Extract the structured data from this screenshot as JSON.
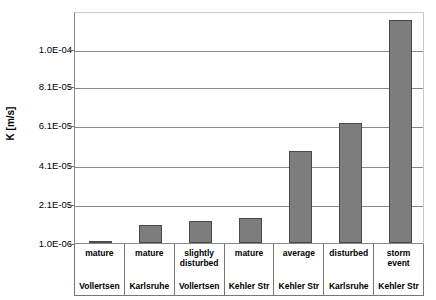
{
  "chart_data": {
    "type": "bar",
    "title": "",
    "subtitle": "",
    "xlabel": "",
    "ylabel": "K [m/s]",
    "ylim": [
      1e-06,
      0.000117
    ],
    "grid": true,
    "legend": false,
    "legend_position": "none",
    "bar_color": "#7d7d7d",
    "bar_edge_color": "#4a4a4a",
    "gridline_color": "#8a8a8a",
    "axis_color": "#6b6b6b",
    "ytick_labels": [
      "1.0E-04",
      "8.1E-05",
      "6.1E-05",
      "4.1E-05",
      "2.1E-05",
      "1.0E-06"
    ],
    "ytick_values": [
      0.0001,
      8.1e-05,
      6.1e-05,
      4.1e-05,
      2.1e-05,
      1e-06
    ],
    "categories": [
      "mature Vollertsen",
      "mature Karlsruhe",
      "slightly disturbed Vollertsen",
      "mature Kehler Str",
      "average Kehler Str",
      "disturbed Karlsruhe",
      "storm event Kehler Str"
    ],
    "category_conditions": [
      "mature",
      "mature",
      "slightly disturbed",
      "mature",
      "average",
      "disturbed",
      "storm event"
    ],
    "category_locations": [
      "Vollertsen",
      "Karlsruhe",
      "Vollertsen",
      "Kehler Str",
      "Kehler Str",
      "Karlsruhe",
      "Kehler Str"
    ],
    "values": [
      2e-06,
      1e-05,
      1.2e-05,
      1.4e-05,
      4.8e-05,
      6.2e-05,
      0.000115
    ],
    "value_labels": [
      "2.0E-06",
      "1.0E-05",
      "1.2E-05",
      "1.4E-05",
      "4.8E-05",
      "6.2E-05",
      "1.15E-04"
    ]
  }
}
